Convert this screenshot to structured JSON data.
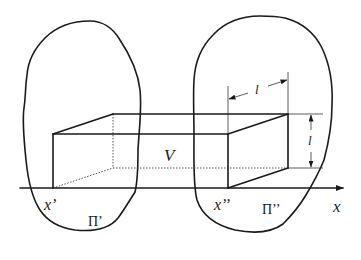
{
  "diagram": {
    "labels": {
      "volume": "V",
      "length_top": "l",
      "length_side": "l",
      "x_prime": "x’",
      "x_double_prime": "x’’",
      "plane_prime": "Π’",
      "plane_double_prime": "Π’’",
      "axis": "x"
    },
    "colors": {
      "line": "#1a1a1a",
      "background": "#ffffff"
    }
  }
}
